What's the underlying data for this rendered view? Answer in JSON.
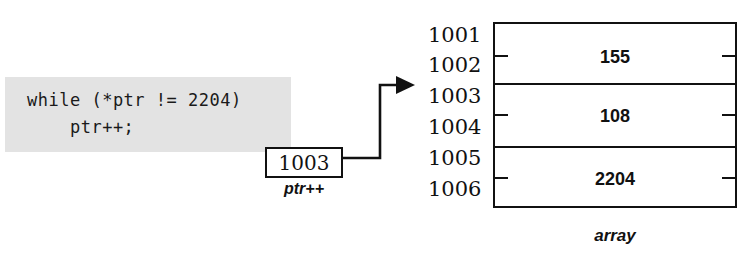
{
  "diagram": {
    "code_block": {
      "background_color": "#e3e3e3",
      "lines": [
        "while (*ptr != 2204)",
        "    ptr++;"
      ]
    },
    "pointer_box": {
      "value": "1003",
      "label": "ptr++"
    },
    "connector": {
      "name": "pointer-to-address-arrow",
      "from": "pointer-box",
      "to": "address-1003",
      "style": "elbow-arrow",
      "color": "#111111"
    },
    "array": {
      "label": "array",
      "border_color": "#111111",
      "addresses": [
        "1001",
        "1002",
        "1003",
        "1004",
        "1005",
        "1006"
      ],
      "cells": [
        {
          "value": "155",
          "start_address": "1001",
          "mid_address": "1002",
          "end_address": "1003"
        },
        {
          "value": "108",
          "start_address": "1003",
          "mid_address": "1004",
          "end_address": "1005"
        },
        {
          "value": "2204",
          "start_address": "1005",
          "mid_address": "1006",
          "end_address": ""
        }
      ]
    }
  }
}
